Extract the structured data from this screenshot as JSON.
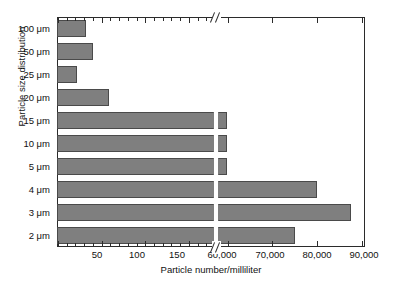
{
  "chart_data": {
    "type": "bar",
    "orientation": "horizontal",
    "title": "",
    "xlabel": "Particle number/milliliter",
    "ylabel": "Particle size distribution",
    "categories": [
      "100 μm",
      "50 μm",
      "25 μm",
      "20 μm",
      "15 μm",
      "10 μm",
      "5 μm",
      "4 μm",
      "3 μm",
      "2 μm"
    ],
    "values": [
      33,
      41,
      23,
      60,
      60000,
      60000,
      60000,
      80200,
      87900,
      75300
    ],
    "value_notes": [
      "100 μm bar extends to about 33 particles/mL",
      "50 μm bar extends to about 41 particles/mL",
      "25 μm bar extends to about 23 particles/mL",
      "20 μm bar extends to about 60 particles/mL",
      "15 μm bar runs off the low-range segment, clipped at the axis break",
      "10 μm bar runs off the low-range segment, clipped at the axis break",
      "5 μm bar runs off the low-range segment, clipped at the axis break",
      "4 μm bar reaches about 80,200 particles/mL",
      "3 μm bar reaches about 87,900 particles/mL",
      "2 μm bar reaches about 75,300 particles/mL"
    ],
    "axis_break": true,
    "axis_break_note": "X axis is broken; the low segment runs 0-180 and the high segment resumes near 58,000 and runs to 90,000",
    "xticks_labeled": [
      "50",
      "100",
      "150",
      "60,000",
      "70,000",
      "80,000",
      "90,000"
    ],
    "xtick_positions_px": [
      97,
      137,
      177,
      222,
      270,
      317,
      364
    ],
    "low_segment_range": [
      0,
      180
    ],
    "high_segment_range": [
      58000,
      91000
    ],
    "grid": false,
    "legend": false,
    "bar_color": "#7f7f7f",
    "bar_edge_color": "#4a4a4a",
    "axis_color": "#2b2b2b",
    "background": "#ffffff"
  },
  "axes": {
    "y_title": "Particle size distribution",
    "x_title": "Particle number/milliliter"
  },
  "y_tick_labels": [
    "100 μm",
    "50 μm",
    "25 μm",
    "20 μm",
    "15 μm",
    "10 μm",
    "5 μm",
    "4 μm",
    "3 μm",
    "2 μm"
  ],
  "x_tick_labels": [
    "50",
    "100",
    "150",
    "60,000",
    "70,000",
    "80,000",
    "90,000"
  ]
}
